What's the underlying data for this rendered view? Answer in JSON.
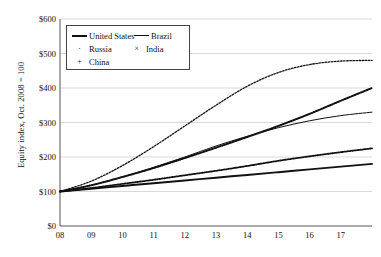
{
  "chart_data": {
    "type": "line",
    "title": "",
    "xlabel": "",
    "ylabel": "Equity index, Oct. 2008 = 100",
    "ylim": [
      0,
      600
    ],
    "ytick_labels": [
      "$0",
      "$100",
      "$200",
      "$300",
      "$400",
      "$500",
      "$600"
    ],
    "ytick_values": [
      0,
      100,
      200,
      300,
      400,
      500,
      600
    ],
    "xtick_labels": [
      "08",
      "09",
      "10",
      "11",
      "12",
      "13",
      "14",
      "15",
      "16",
      "17"
    ],
    "x": [
      2008,
      2009,
      2010,
      2011,
      2012,
      2013,
      2014,
      2015,
      2016,
      2017,
      2018
    ],
    "grid": "horizontal",
    "legend_position": "upper-left-inside",
    "series": [
      {
        "name": "United States",
        "style": "solid-thick",
        "values": [
          100,
          108,
          116,
          124,
          132,
          140,
          148,
          156,
          164,
          172,
          180
        ]
      },
      {
        "name": "Brazil",
        "style": "solid-thin",
        "values": [
          100,
          118,
          142,
          170,
          200,
          232,
          260,
          285,
          305,
          320,
          330
        ]
      },
      {
        "name": "Russia",
        "style": "dotted",
        "values": [
          100,
          130,
          175,
          230,
          290,
          350,
          405,
          445,
          468,
          478,
          480
        ]
      },
      {
        "name": "India",
        "style": "x-marker",
        "values": [
          100,
          118,
          142,
          168,
          197,
          227,
          258,
          290,
          325,
          363,
          400
        ]
      },
      {
        "name": "China",
        "style": "plus-marker",
        "values": [
          100,
          110,
          122,
          134,
          147,
          160,
          174,
          189,
          202,
          214,
          225
        ]
      }
    ]
  },
  "legend": {
    "entries": [
      {
        "label": "United States",
        "key": "solid-thick-key"
      },
      {
        "label": "Brazil",
        "key": "solid-thin-key"
      },
      {
        "label": "Russia",
        "key": "dot-key"
      },
      {
        "label": "India",
        "key": "x-key"
      },
      {
        "label": "China",
        "key": "plus-key"
      }
    ]
  },
  "axis": {
    "y_title": "Equity index, Oct. 2008 = 100"
  }
}
